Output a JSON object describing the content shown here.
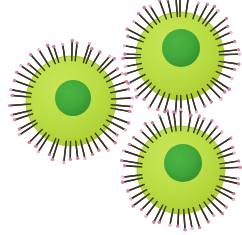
{
  "figure": {
    "type": "scientific-illustration",
    "background_color": "#ffffff",
    "width": 242,
    "height": 235
  },
  "palette": {
    "background": "#ffffff",
    "envelope_fill": "#b5d93f",
    "envelope_fill_light": "#c3e04f",
    "envelope_edge": "#a8cc2e",
    "nucleus_fill": "#3fa63a",
    "nucleus_fill_dark": "#349130",
    "spike_stalk": "#3a3326",
    "spike_stalk_light": "#6b6150",
    "spike_tip": "#d4819a",
    "spike_tip_light": "#e8b4c4",
    "spike_base": "#8a7a42"
  },
  "particles": [
    {
      "id": "particle-left",
      "label": "Virus particle (left)",
      "center_x": 71,
      "center_y": 101,
      "envelope_radius": 45,
      "nucleus_center_x": 73,
      "nucleus_center_y": 98,
      "nucleus_radius": 18,
      "spike_count": 46,
      "spike_length": 13,
      "rotation_offset": 4
    },
    {
      "id": "particle-top-right",
      "label": "Virus particle (top right)",
      "center_x": 180,
      "center_y": 56,
      "envelope_radius": 44,
      "nucleus_center_x": 181,
      "nucleus_center_y": 48,
      "nucleus_radius": 19,
      "spike_count": 45,
      "spike_length": 13,
      "rotation_offset": 0
    },
    {
      "id": "particle-bottom-right",
      "label": "Virus particle (bottom right)",
      "center_x": 181,
      "center_y": 170,
      "envelope_radius": 44,
      "nucleus_center_x": 183,
      "nucleus_center_y": 163,
      "nucleus_radius": 19,
      "spike_count": 45,
      "spike_length": 13,
      "rotation_offset": 7
    }
  ],
  "structures": {
    "envelope_name": "lipid envelope",
    "nucleus_name": "nucleocapsid core",
    "spike_name": "surface glycoprotein spike"
  }
}
